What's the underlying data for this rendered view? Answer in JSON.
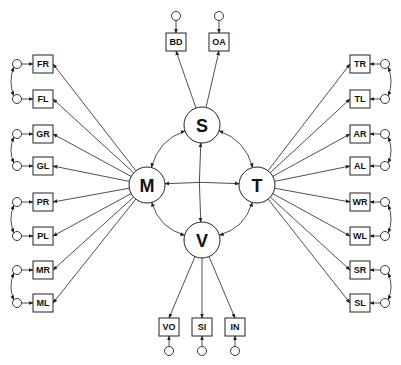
{
  "diagram": {
    "type": "structural-equation-model",
    "colors": {
      "stroke": "#222222",
      "background": "#ffffff"
    },
    "latent_factors": [
      {
        "id": "S",
        "label": "S",
        "cx": 202,
        "cy": 125
      },
      {
        "id": "M",
        "label": "M",
        "cx": 147,
        "cy": 185
      },
      {
        "id": "T",
        "label": "T",
        "cx": 257,
        "cy": 185
      },
      {
        "id": "V",
        "label": "V",
        "cx": 202,
        "cy": 240
      }
    ],
    "left_indicators": [
      {
        "label": "FR",
        "cy": 64
      },
      {
        "label": "FL",
        "cy": 99
      },
      {
        "label": "GR",
        "cy": 134
      },
      {
        "label": "GL",
        "cy": 166
      },
      {
        "label": "PR",
        "cy": 202
      },
      {
        "label": "PL",
        "cy": 236
      },
      {
        "label": "MR",
        "cy": 270
      },
      {
        "label": "ML",
        "cy": 303
      }
    ],
    "right_indicators": [
      {
        "label": "TR",
        "cy": 64
      },
      {
        "label": "TL",
        "cy": 99
      },
      {
        "label": "AR",
        "cy": 134
      },
      {
        "label": "AL",
        "cy": 166
      },
      {
        "label": "WR",
        "cy": 202
      },
      {
        "label": "WL",
        "cy": 236
      },
      {
        "label": "SR",
        "cy": 270
      },
      {
        "label": "SL",
        "cy": 303
      }
    ],
    "top_indicators": [
      {
        "label": "BD",
        "cx": 176
      },
      {
        "label": "OA",
        "cx": 219
      }
    ],
    "bottom_indicators": [
      {
        "label": "VO",
        "cx": 169
      },
      {
        "label": "SI",
        "cx": 202
      },
      {
        "label": "IN",
        "cx": 235
      }
    ],
    "factor_loadings": {
      "M": [
        "FR",
        "FL",
        "GR",
        "GL",
        "PR",
        "PL",
        "MR",
        "ML"
      ],
      "T": [
        "TR",
        "TL",
        "AR",
        "AL",
        "WR",
        "WL",
        "SR",
        "SL"
      ],
      "S": [
        "BD",
        "OA"
      ],
      "V": [
        "VO",
        "SI",
        "IN"
      ]
    },
    "factor_correlations": [
      [
        "S",
        "M"
      ],
      [
        "S",
        "T"
      ],
      [
        "M",
        "V"
      ],
      [
        "T",
        "V"
      ],
      [
        "M",
        "T"
      ],
      [
        "S",
        "V"
      ]
    ],
    "error_correlations": [
      [
        "FR",
        "FL"
      ],
      [
        "GR",
        "GL"
      ],
      [
        "PR",
        "PL"
      ],
      [
        "MR",
        "ML"
      ],
      [
        "TR",
        "TL"
      ],
      [
        "AR",
        "AL"
      ],
      [
        "WR",
        "WL"
      ],
      [
        "SR",
        "SL"
      ]
    ]
  }
}
